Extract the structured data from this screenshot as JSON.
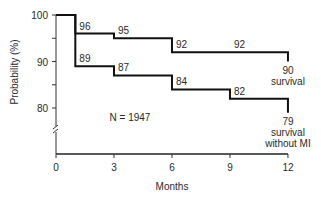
{
  "chart_data": {
    "type": "line",
    "subtype": "step",
    "title": "",
    "xlabel": "Months",
    "ylabel": "Probability (%)",
    "x_ticks": [
      0,
      3,
      6,
      9,
      12
    ],
    "y_ticks": [
      80,
      90,
      100
    ],
    "ylim": [
      70,
      100
    ],
    "xlim": [
      0,
      12
    ],
    "axis_break": true,
    "grid": false,
    "annotation": "N = 1947",
    "series": [
      {
        "name": "survival",
        "end_label": [
          "90",
          "survival"
        ],
        "steps": [
          {
            "x": 0,
            "y": 100
          },
          {
            "x": 1,
            "y": 96
          },
          {
            "x": 3,
            "y": 95
          },
          {
            "x": 6,
            "y": 92
          },
          {
            "x": 12,
            "y": 90
          }
        ],
        "point_labels": [
          {
            "x": 1,
            "y": 96,
            "text": "96"
          },
          {
            "x": 3,
            "y": 95,
            "text": "95"
          },
          {
            "x": 6,
            "y": 92,
            "text": "92"
          },
          {
            "x": 9,
            "y": 92,
            "text": "92"
          }
        ]
      },
      {
        "name": "survival without MI",
        "end_label": [
          "79",
          "survival",
          "without MI"
        ],
        "steps": [
          {
            "x": 0,
            "y": 100
          },
          {
            "x": 1,
            "y": 89
          },
          {
            "x": 3,
            "y": 87
          },
          {
            "x": 6,
            "y": 84
          },
          {
            "x": 9,
            "y": 82
          },
          {
            "x": 12,
            "y": 79
          }
        ],
        "point_labels": [
          {
            "x": 1,
            "y": 89,
            "text": "89"
          },
          {
            "x": 3,
            "y": 87,
            "text": "87"
          },
          {
            "x": 6,
            "y": 84,
            "text": "84"
          },
          {
            "x": 9,
            "y": 82,
            "text": "82"
          }
        ]
      }
    ]
  }
}
